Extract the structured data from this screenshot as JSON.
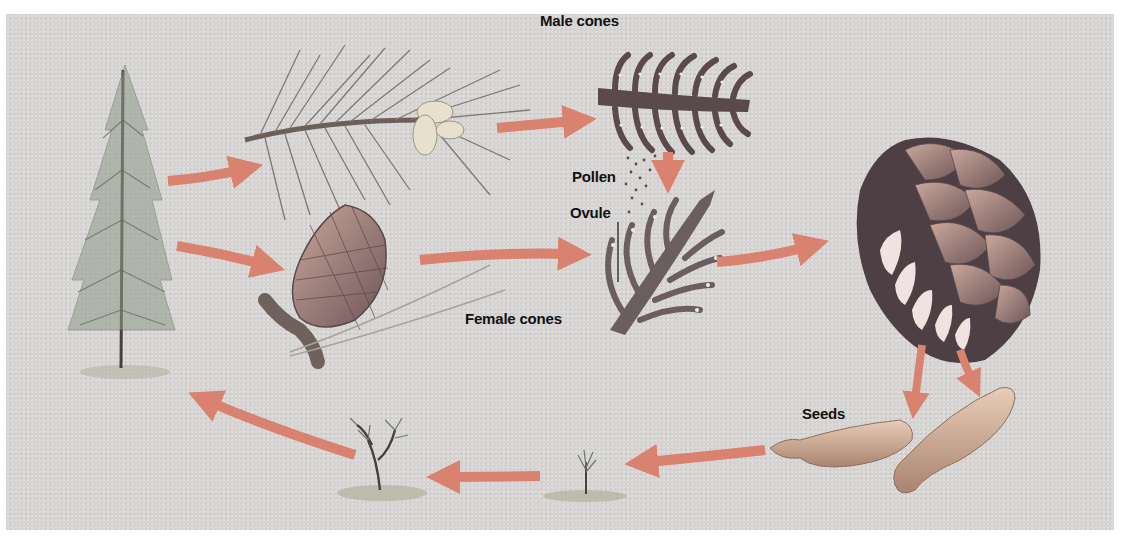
{
  "colors": {
    "background": "#d6d4d2",
    "arrow": "#d9826f",
    "ink": "#111111",
    "cone_dark": "#5a4a4e",
    "seed": "#c9a78f",
    "plant": "#6f7a68"
  },
  "labels": {
    "male_cones": "Male cones",
    "pollen": "Pollen",
    "ovule": "Ovule",
    "female_cones": "Female cones",
    "seeds": "Seeds"
  },
  "stages": [
    {
      "id": "mature-tree",
      "description": "Mature pine tree"
    },
    {
      "id": "branch-with-male-cones",
      "description": "Branch with pollen cones"
    },
    {
      "id": "male-cone-section",
      "description": "Male cone cross-section",
      "label": "Male cones"
    },
    {
      "id": "female-cone",
      "description": "Young female cone on twig"
    },
    {
      "id": "female-cone-section",
      "description": "Female cone cross-section receiving pollen",
      "label": "Female cones"
    },
    {
      "id": "mature-cone-section",
      "description": "Mature seed cone releasing seeds"
    },
    {
      "id": "seeds",
      "description": "Winged seeds",
      "label": "Seeds"
    },
    {
      "id": "seedling",
      "description": "Germinating seedling"
    },
    {
      "id": "sapling",
      "description": "Young sapling"
    }
  ],
  "flow": [
    "mature-tree -> branch-with-male-cones",
    "mature-tree -> female-cone",
    "branch-with-male-cones -> male-cone-section",
    "male-cone-section -> female-cone-section (pollen)",
    "female-cone -> female-cone-section",
    "female-cone-section -> mature-cone-section",
    "mature-cone-section -> seeds",
    "seeds -> seedling",
    "seedling -> sapling",
    "sapling -> mature-tree"
  ]
}
